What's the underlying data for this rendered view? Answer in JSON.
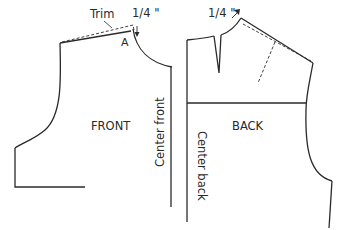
{
  "diagram": {
    "type": "sewing-pattern",
    "front": {
      "label": "FRONT",
      "center_label": "Center front",
      "trim_label": "Trim",
      "point_label": "A",
      "measure_label": "1/4 \""
    },
    "back": {
      "label": "BACK",
      "center_label": "Center back",
      "measure_label": "1/4 \""
    },
    "colors": {
      "line": "#2a2a2a",
      "background": "#ffffff"
    }
  }
}
